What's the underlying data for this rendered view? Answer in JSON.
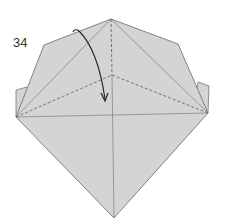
{
  "diagram": {
    "step_number": "34",
    "paper_color": "#d4d4d4",
    "line_color": "#777777",
    "dashed_line_color": "#666666",
    "arrow_color": "#222222",
    "points": {
      "apex": [
        111,
        19
      ],
      "left_shoulder": [
        44,
        45
      ],
      "right_shoulder": [
        178,
        44
      ],
      "left_corner": [
        16,
        117
      ],
      "right_corner": [
        208,
        113
      ],
      "center": [
        112,
        75
      ],
      "bottom": [
        114,
        218
      ],
      "left_flap_top": [
        16,
        90
      ],
      "left_flap_inner": [
        27,
        87
      ],
      "right_flap_inner": [
        198,
        82
      ],
      "right_flap_top": [
        209,
        86
      ]
    },
    "fold_type": "valley-fold",
    "arrow_description": "curved arrow folding top flap down to center"
  }
}
